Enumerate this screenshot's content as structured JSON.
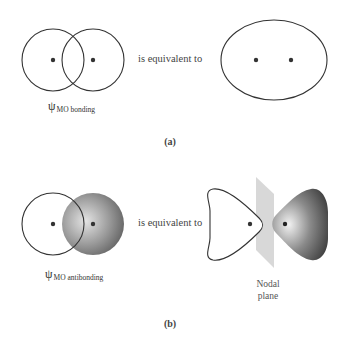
{
  "figure": {
    "panel_a": {
      "caption": "(a)",
      "equivalence_text": "is equivalent to",
      "psi_symbol": "ψ",
      "psi_subscript": "MO bonding",
      "left_diagram": "two overlapping unshaded circles with nuclei dots",
      "right_diagram": "single ellipse enclosing two nuclei dots"
    },
    "panel_b": {
      "caption": "(b)",
      "equivalence_text": "is equivalent to",
      "psi_symbol": "ψ",
      "psi_subscript": "MO antibonding",
      "nodal_label_line1": "Nodal",
      "nodal_label_line2": "plane",
      "left_diagram": "unshaded circle overlapping shaded sphere",
      "right_diagram": "two lobes separated by a nodal plane"
    },
    "colors": {
      "stroke": "#333333",
      "border": "#7a7a7a",
      "shade_light": "#d8d8d8",
      "shade_dark": "#3a3a3a",
      "plane": "#d4d4d4"
    }
  }
}
